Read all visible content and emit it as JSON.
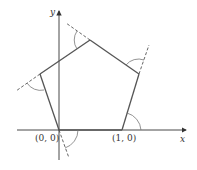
{
  "diagram": {
    "type": "pentagon-exterior-angles",
    "axes": {
      "x_label": "x",
      "y_label": "y"
    },
    "points": [
      {
        "id": "origin",
        "label": "(0, 0)"
      },
      {
        "id": "unit",
        "label": "(1, 0)"
      }
    ],
    "colors": {
      "polygon": "#555555",
      "axis": "#333333",
      "dashed": "#555555",
      "arc": "#777777",
      "text": "#333333"
    }
  }
}
